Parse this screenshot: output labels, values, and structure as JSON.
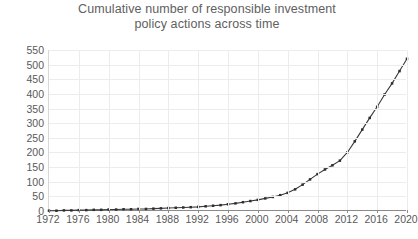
{
  "chart_data": {
    "type": "line",
    "title": "Cumulative number of responsible investment policy actions across time",
    "title_lines": [
      "Cumulative number of responsible investment",
      "policy actions across time"
    ],
    "xlabel": "",
    "ylabel": "",
    "xlim": [
      1972,
      2020
    ],
    "ylim": [
      0,
      550
    ],
    "ytick_step": 50,
    "xtick_step": 4,
    "grid": true,
    "legend": "none",
    "marker": "square",
    "line_color": "#3a3a3a",
    "marker_color": "#2e2e2e",
    "grid_color": "#ececec",
    "axis_color": "#8a8a8a",
    "text_color": "#595959",
    "yticks": [
      0,
      50,
      100,
      150,
      200,
      250,
      300,
      350,
      400,
      450,
      500,
      550
    ],
    "xticks": [
      1972,
      1976,
      1980,
      1984,
      1988,
      1992,
      1996,
      2000,
      2004,
      2008,
      2012,
      2016,
      2020
    ],
    "x": [
      1972,
      1973,
      1974,
      1975,
      1976,
      1977,
      1978,
      1979,
      1980,
      1981,
      1982,
      1983,
      1984,
      1985,
      1986,
      1987,
      1988,
      1989,
      1990,
      1991,
      1992,
      1993,
      1994,
      1995,
      1996,
      1997,
      1998,
      1999,
      2000,
      2001,
      2002,
      2003,
      2004,
      2005,
      2006,
      2007,
      2008,
      2009,
      2010,
      2011,
      2012,
      2013,
      2014,
      2015,
      2016,
      2017,
      2018,
      2019,
      2020
    ],
    "values": [
      1,
      1,
      2,
      2,
      3,
      3,
      4,
      4,
      5,
      5,
      6,
      6,
      7,
      7,
      8,
      9,
      10,
      11,
      12,
      13,
      14,
      16,
      18,
      20,
      23,
      26,
      30,
      34,
      38,
      43,
      48,
      54,
      62,
      74,
      90,
      108,
      126,
      142,
      156,
      172,
      200,
      238,
      278,
      318,
      356,
      398,
      436,
      478,
      520
    ],
    "series_name": "Cumulative policy actions"
  }
}
